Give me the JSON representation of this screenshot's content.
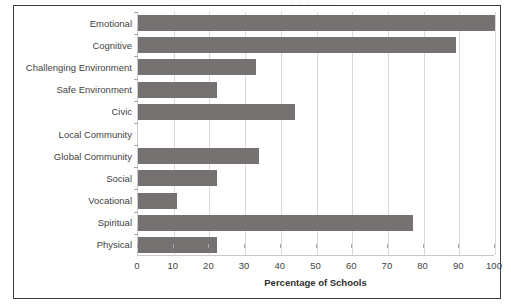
{
  "figure": {
    "background_color": "#ffffff",
    "frame_color": "#3a3a3c",
    "scan_artifact_text": "· · · · · · · · · · · · · · · · · · · ·"
  },
  "chart_data": {
    "type": "bar",
    "orientation": "horizontal",
    "title": "",
    "subtitle": "",
    "xlabel": "Percentage of Schools",
    "ylabel": "",
    "xlim": [
      0,
      100
    ],
    "xticks": [
      0,
      10,
      20,
      30,
      40,
      50,
      60,
      70,
      80,
      90,
      100
    ],
    "xtick_labels": [
      "0",
      "10",
      "20",
      "30",
      "40",
      "50",
      "60",
      "70",
      "80",
      "90",
      "100"
    ],
    "grid": "vertical",
    "legend": "none",
    "bar_color": "#767171",
    "gridline_color": "#d9d9d9",
    "axis_color": "#c9c9c9",
    "categories": [
      "Emotional",
      "Cognitive",
      "Challenging Environment",
      "Safe Environment",
      "Civic",
      "Local Community",
      "Global Community",
      "Social",
      "Vocational",
      "Spiritual",
      "Physical"
    ],
    "values": [
      100,
      89,
      33,
      22,
      44,
      0,
      34,
      22,
      11,
      77,
      22
    ],
    "series": [
      {
        "name": "Percentage of Schools",
        "values": [
          100,
          89,
          33,
          22,
          44,
          0,
          34,
          22,
          11,
          77,
          22
        ]
      }
    ]
  }
}
